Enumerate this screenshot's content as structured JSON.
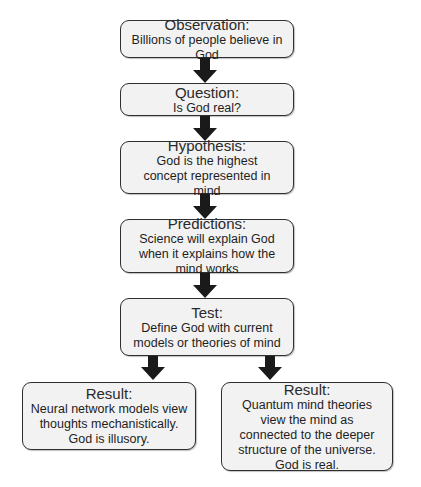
{
  "flowchart": {
    "nodes": [
      {
        "id": "observation",
        "title": "Observation:",
        "text": "Billions of people believe in God"
      },
      {
        "id": "question",
        "title": "Question:",
        "text": "Is God real?"
      },
      {
        "id": "hypothesis",
        "title": "Hypothesis:",
        "text": "God is the highest concept represented in mind"
      },
      {
        "id": "predictions",
        "title": "Predictions:",
        "text": "Science will explain God when it explains how the mind works"
      },
      {
        "id": "test",
        "title": "Test:",
        "text": "Define God with current models or theories of mind"
      },
      {
        "id": "result-left",
        "title": "Result:",
        "text": "Neural network models view thoughts mechanistically. God is illusory."
      },
      {
        "id": "result-right",
        "title": "Result:",
        "text": "Quantum mind theories view the mind as connected to the deeper structure of the universe. God is real."
      }
    ],
    "edges": [
      {
        "from": "observation",
        "to": "question"
      },
      {
        "from": "question",
        "to": "hypothesis"
      },
      {
        "from": "hypothesis",
        "to": "predictions"
      },
      {
        "from": "predictions",
        "to": "test"
      },
      {
        "from": "test",
        "to": "result-left"
      },
      {
        "from": "test",
        "to": "result-right"
      }
    ],
    "colors": {
      "box_fill": "#f2f2f2",
      "box_border": "#2f2f2f",
      "arrow": "#1a1a1a",
      "background": "#ffffff"
    }
  }
}
